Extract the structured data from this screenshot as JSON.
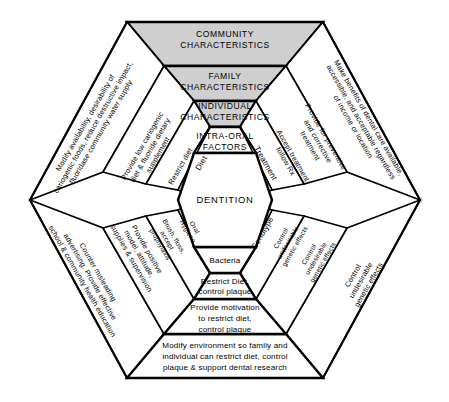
{
  "diagram": {
    "center": {
      "label": "DENTITION"
    },
    "shaded_color": "#cfcfcf",
    "rings": [
      {
        "name": "intra-oral-factors",
        "segments": {
          "top": "INTRA-ORAL\nFACTORS",
          "top_left": "Diet",
          "top_right": "Treatment",
          "bottom_left": "Oral\nHygiene",
          "bottom_right": "Genotype",
          "bottom": "Bacteria"
        }
      },
      {
        "name": "individual-characteristics",
        "shaded": true,
        "segments": {
          "top": "INDIVIDUAL\nCHARACTERISTICS",
          "top_left": "Restrict diet",
          "top_right": "Accept treatment;\nfollow Rx",
          "bottom_left": "Brush, floss,\naccept\nprophylaxis",
          "bottom_right": "Control\nundesirable\ngenetic effects",
          "bottom": "Restrict Diet,\ncontrol plaque"
        }
      },
      {
        "name": "family-characteristics",
        "shaded": true,
        "segments": {
          "top": "FAMILY\nCHARACTERISTICS",
          "top_left": "Provide low cariogenic\ndiet & fluoride dietary\nsupplement",
          "top_right": "Provide for preventive\nand corrective\ntreatment",
          "bottom_left": "Provide positive\nmodel, attitude,\nsupplies & supervision",
          "bottom_right": "Control\nundesirable\ngenetic effects",
          "bottom": "Provide motivation\nto restrict diet,\ncontrol plaque"
        }
      },
      {
        "name": "community-characteristics",
        "shaded": true,
        "segments": {
          "top": "COMMUNITY\nCHARACTERISTICS",
          "top_left": "Modify availability, desirability of\ncariogenic foods, reduce destructive impact,\nfluoridase community water supply",
          "top_right": "Make benefits of dental care available,\naccessible, and acceptable regardless\nof income or location",
          "bottom_left": "Counter misleading\nadvertising. Provide effective\nschool & community health education",
          "bottom_right": "Control\nundesirable\ngenetic effects",
          "bottom": "Modify environment so family and\nindividual can restrict diet, control\nplaque & support dental research"
        }
      }
    ]
  }
}
